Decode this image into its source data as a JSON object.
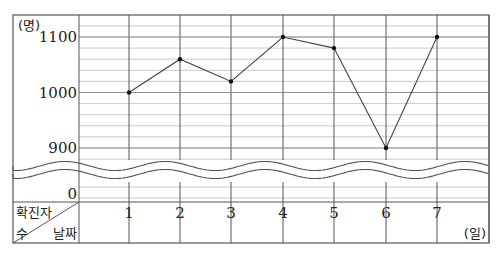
{
  "chart_data": {
    "type": "line",
    "title": "",
    "xlabel": "날짜",
    "xunit": "(일)",
    "ylabel": "확진자 수",
    "yunit": "(명)",
    "categories": [
      "1",
      "2",
      "3",
      "4",
      "5",
      "6",
      "7"
    ],
    "series": [
      {
        "name": "확진자 수",
        "values": [
          1000,
          1060,
          1020,
          1100,
          1080,
          900,
          1100
        ]
      }
    ],
    "y_ticks": [
      1100,
      1000,
      900,
      0
    ],
    "ylim": [
      880,
      1140
    ],
    "axis_break": {
      "between": [
        0,
        880
      ],
      "style": "wavy"
    },
    "minor_grid_step": 20,
    "grid": true,
    "legend": null
  },
  "labels": {
    "yunit": "(명)",
    "y1100": "1100",
    "y1000": "1000",
    "y900": "900",
    "y0": "0",
    "corner_top": "확진자",
    "corner_bottom_left": "수",
    "corner_bottom_right": "날짜",
    "xunit": "(일)",
    "days": [
      "1",
      "2",
      "3",
      "4",
      "5",
      "6",
      "7"
    ]
  },
  "colors": {
    "line": "#444444",
    "grid_major": "#555555",
    "grid_minor": "#bbbbbb",
    "text": "#222222",
    "point": "#111111"
  }
}
